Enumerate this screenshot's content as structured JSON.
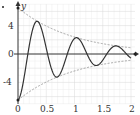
{
  "chart_data": {
    "type": "line",
    "title": "",
    "xlabel": "",
    "ylabel": "y",
    "xlim": [
      0,
      2
    ],
    "ylim": [
      -7,
      7
    ],
    "x_ticks": [
      "0",
      "0.5",
      "1",
      "1.5",
      "2"
    ],
    "y_ticks": [
      "4",
      "0",
      "-4"
    ],
    "grid": true,
    "series": [
      {
        "name": "damped oscillation",
        "style": "solid",
        "formula": "-6.5*exp(-x)*cos(9x)",
        "color": "#333333"
      },
      {
        "name": "upper envelope",
        "style": "dashed",
        "formula": "6.5*exp(-x)",
        "color": "#888888"
      },
      {
        "name": "lower envelope",
        "style": "dashed",
        "formula": "-6.5*exp(-x)",
        "color": "#888888"
      }
    ],
    "annotations": [
      {
        "label": "start point",
        "x": 0,
        "y": -6.5
      }
    ]
  },
  "axes": {
    "y_label": "y",
    "x_ticks": [
      "0",
      "0.5",
      "1",
      "1.5",
      "2"
    ],
    "y_ticks": [
      "4",
      "0",
      "-4"
    ]
  }
}
